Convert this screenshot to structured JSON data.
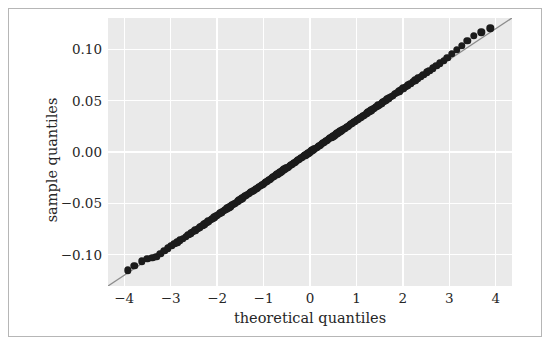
{
  "chart_data": {
    "type": "scatter",
    "title": "",
    "xlabel": "theoretical quantiles",
    "ylabel": "sample quantiles",
    "xlim": [
      -4.35,
      4.35
    ],
    "ylim": [
      -0.1305,
      0.1305
    ],
    "xticks": [
      -4,
      -3,
      -2,
      -1,
      0,
      1,
      2,
      3,
      4
    ],
    "xticklabels": [
      "−4",
      "−3",
      "−2",
      "−1",
      "0",
      "1",
      "2",
      "3",
      "4"
    ],
    "yticks": [
      -0.1,
      -0.05,
      0.0,
      0.05,
      0.1
    ],
    "yticklabels": [
      "−0.10",
      "−0.05",
      "0.00",
      "0.05",
      "0.10"
    ],
    "grid": true,
    "legend": false,
    "legend_position": "none",
    "series": [
      {
        "name": "sample quantiles",
        "marker": "circle",
        "color": "#1b1b1b",
        "x": [
          -3.92,
          -3.78,
          -3.62,
          -3.5,
          -3.4,
          -3.31,
          -3.22,
          -3.14,
          -3.06,
          -2.99,
          -2.92,
          -2.86,
          -2.8,
          -2.74,
          -2.68,
          -2.62,
          -2.57,
          -2.52,
          -2.47,
          -2.42,
          -2.37,
          -2.32,
          -2.28,
          -2.23,
          -2.19,
          -2.14,
          -2.1,
          -2.06,
          -2.02,
          -1.98,
          -1.94,
          -1.9,
          -1.86,
          -1.82,
          -1.78,
          -1.74,
          -1.71,
          -1.67,
          -1.63,
          -1.6,
          -1.56,
          -1.53,
          -1.49,
          -1.46,
          -1.42,
          -1.39,
          -1.36,
          -1.32,
          -1.29,
          -1.26,
          -1.22,
          -1.19,
          -1.16,
          -1.13,
          -1.1,
          -1.06,
          -1.03,
          -1.0,
          -0.97,
          -0.94,
          -0.91,
          -0.88,
          -0.85,
          -0.82,
          -0.79,
          -0.76,
          -0.73,
          -0.7,
          -0.67,
          -0.64,
          -0.61,
          -0.58,
          -0.55,
          -0.52,
          -0.49,
          -0.46,
          -0.43,
          -0.4,
          -0.37,
          -0.34,
          -0.31,
          -0.28,
          -0.25,
          -0.22,
          -0.19,
          -0.16,
          -0.13,
          -0.1,
          -0.07,
          -0.04,
          -0.01,
          0.02,
          0.05,
          0.08,
          0.11,
          0.14,
          0.17,
          0.2,
          0.23,
          0.26,
          0.29,
          0.32,
          0.35,
          0.38,
          0.41,
          0.44,
          0.47,
          0.5,
          0.53,
          0.56,
          0.59,
          0.62,
          0.65,
          0.68,
          0.71,
          0.74,
          0.77,
          0.8,
          0.83,
          0.86,
          0.89,
          0.92,
          0.95,
          0.99,
          1.02,
          1.05,
          1.08,
          1.12,
          1.15,
          1.18,
          1.22,
          1.25,
          1.29,
          1.32,
          1.36,
          1.39,
          1.43,
          1.47,
          1.5,
          1.54,
          1.58,
          1.62,
          1.66,
          1.7,
          1.74,
          1.78,
          1.83,
          1.87,
          1.92,
          1.96,
          2.01,
          2.06,
          2.11,
          2.16,
          2.21,
          2.27,
          2.32,
          2.38,
          2.44,
          2.51,
          2.57,
          2.64,
          2.72,
          2.79,
          2.88,
          2.96,
          3.06,
          3.16,
          3.27,
          3.39,
          3.53,
          3.69,
          3.88
        ],
        "y": [
          -0.1152,
          -0.1108,
          -0.1065,
          -0.104,
          -0.103,
          -0.1018,
          -0.099,
          -0.0962,
          -0.0937,
          -0.0916,
          -0.0897,
          -0.0879,
          -0.0861,
          -0.0843,
          -0.0826,
          -0.0808,
          -0.0792,
          -0.0777,
          -0.0762,
          -0.0747,
          -0.0732,
          -0.0717,
          -0.0703,
          -0.0689,
          -0.0676,
          -0.0662,
          -0.0649,
          -0.0636,
          -0.0623,
          -0.0611,
          -0.0598,
          -0.0586,
          -0.0574,
          -0.0562,
          -0.055,
          -0.0538,
          -0.0527,
          -0.0515,
          -0.0503,
          -0.0493,
          -0.0481,
          -0.0471,
          -0.046,
          -0.045,
          -0.0438,
          -0.0428,
          -0.0419,
          -0.0407,
          -0.0397,
          -0.0388,
          -0.0376,
          -0.0367,
          -0.0357,
          -0.0348,
          -0.0339,
          -0.0327,
          -0.0317,
          -0.0308,
          -0.0299,
          -0.029,
          -0.028,
          -0.0271,
          -0.0262,
          -0.0253,
          -0.0243,
          -0.0234,
          -0.0225,
          -0.0216,
          -0.0206,
          -0.0197,
          -0.0188,
          -0.0179,
          -0.0169,
          -0.016,
          -0.0151,
          -0.0142,
          -0.0132,
          -0.0123,
          -0.0114,
          -0.0105,
          -0.0095,
          -0.0086,
          -0.0077,
          -0.0068,
          -0.0058,
          -0.0049,
          -0.004,
          -0.0031,
          -0.0021,
          -0.0012,
          -0.0003,
          0.0006,
          0.0015,
          0.0025,
          0.0034,
          0.0043,
          0.0052,
          0.0062,
          0.0071,
          0.008,
          0.0089,
          0.0099,
          0.0108,
          0.0117,
          0.0126,
          0.0136,
          0.0145,
          0.0154,
          0.0163,
          0.0173,
          0.0182,
          0.0191,
          0.02,
          0.021,
          0.0219,
          0.0228,
          0.0237,
          0.0247,
          0.0256,
          0.0265,
          0.0274,
          0.0284,
          0.0293,
          0.0305,
          0.0315,
          0.0324,
          0.0333,
          0.0345,
          0.0355,
          0.0364,
          0.0376,
          0.0385,
          0.0397,
          0.0407,
          0.0419,
          0.0428,
          0.044,
          0.0453,
          0.0462,
          0.0474,
          0.0487,
          0.0499,
          0.0512,
          0.0524,
          0.0537,
          0.0549,
          0.0565,
          0.0577,
          0.0592,
          0.0605,
          0.062,
          0.0636,
          0.0651,
          0.0667,
          0.0682,
          0.07,
          0.0716,
          0.0734,
          0.0753,
          0.0775,
          0.0793,
          0.0815,
          0.084,
          0.0862,
          0.089,
          0.0915,
          0.0955,
          0.0995,
          0.1035,
          0.1085,
          0.113,
          0.1165,
          0.1205
        ]
      }
    ],
    "reference_line": {
      "name": "45-degree reference line",
      "color": "#8c8c8c",
      "x": [
        -4.35,
        4.35
      ],
      "y": [
        -0.1305,
        0.1305
      ]
    }
  },
  "style": {
    "panel_background": "#eaeaea",
    "figure_background": "#ffffff",
    "gridline_color": "#ffffff",
    "marker_color": "#1b1b1b",
    "reference_line_color": "#8c8c8c",
    "text_color": "#262626",
    "border_color": "#b6b6b6"
  }
}
